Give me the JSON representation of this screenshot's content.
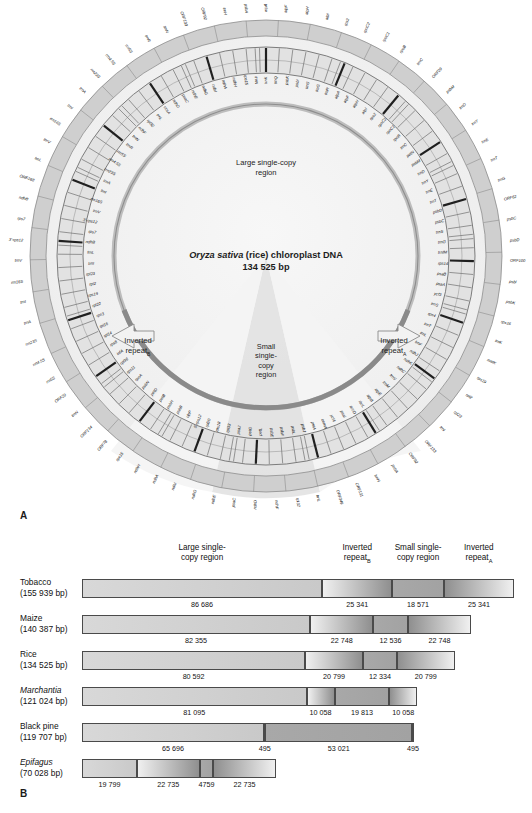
{
  "figure": {
    "panel_a_label": "A",
    "panel_b_label": "B"
  },
  "panel_a": {
    "title_species": "Oryza sativa",
    "title_rest": " (rice) chloroplast DNA",
    "title_size": "134 525 bp",
    "regions": {
      "lsc": "Large single-copy\nregion",
      "lsc_line1": "Large single-copy",
      "lsc_line2": "region",
      "irb_line1": "Inverted",
      "irb_line2": "repeat",
      "irb_sub": "B",
      "ira_line1": "Inverted",
      "ira_line2": "repeat",
      "ira_sub": "A",
      "ssc_line1": "Small",
      "ssc_line2": "single-",
      "ssc_line3": "copy",
      "ssc_line4": "region"
    },
    "genes_outer": [
      "atpA",
      "atpF",
      "atpH",
      "atpI",
      "rps2",
      "rpoC2",
      "rpoC1",
      "rpoB",
      "trnC",
      "ORF29",
      "psbM",
      "trnD",
      "trnY",
      "trnE",
      "trnT",
      "trnG",
      "ORF62",
      "psbC",
      "psbD",
      "ORF100",
      "psbI",
      "psbK",
      "rps16",
      "trnK",
      "matK",
      "rps19",
      "rpl2",
      "rpl23",
      "trnI",
      "ORF133",
      "ORF92",
      "psbA",
      "trnH",
      "ORF131",
      "ORF349",
      "trnL",
      "rpl32",
      "ndhF",
      "ndhD",
      "psaC",
      "ndhE",
      "ndhG",
      "ndhI",
      "ndhA",
      "ndhH",
      "rps15",
      "ORF78",
      "ORF134",
      "trnN",
      "ORF29",
      "rrn5S",
      "rrn4.5S",
      "rrn23S",
      "trnA",
      "trnI",
      "rrn16S",
      "trnV",
      "3'-rps12",
      "rps7",
      "ndhB",
      "ORF168",
      "trnL",
      "trnV",
      "rrn16S",
      "trnI",
      "trnA",
      "rrn23S",
      "rrn4.5S",
      "rrn5S",
      "trnR",
      "trnN",
      "ORF133",
      "ORF92",
      "trnH",
      "psbA"
    ],
    "genes_inner": [
      "trnK",
      "trnQ",
      "psbK",
      "psbI",
      "trnS",
      "trnG",
      "trnR",
      "atpA",
      "atpF",
      "atpH",
      "atpI",
      "rps2",
      "rpoC2",
      "rpoC1",
      "rpoB",
      "trnC",
      "petN",
      "psbM",
      "trnD",
      "trnY",
      "trnE",
      "trnT",
      "psbD",
      "psbC",
      "trnS",
      "trnG",
      "trnfM",
      "rps14",
      "psaB",
      "psaA",
      "ycf3",
      "trnS",
      "rps4",
      "trnT",
      "trnL",
      "trnF",
      "ndhJ",
      "ndhK",
      "ndhC",
      "trnV",
      "trnM",
      "atpE",
      "atpB",
      "rbcL",
      "accD",
      "psaI",
      "ycf4",
      "cemA",
      "petA",
      "psbJ",
      "psbL",
      "psbF",
      "psbE",
      "petL",
      "petG",
      "psaJ",
      "rpl33",
      "rps18",
      "rpl20",
      "5'-rps12",
      "clpP",
      "psbB",
      "psbH",
      "petB",
      "petD",
      "psbN",
      "rpoA",
      "rps11",
      "rpl36",
      "infA",
      "rps8",
      "rpl14",
      "rpl16",
      "rps3",
      "rpl22",
      "rps19",
      "rpl2",
      "rpl23",
      "trnI",
      "trnL",
      "ndhB",
      "rps7",
      "3'-rps12",
      "trnV",
      "rrn16S",
      "trnI",
      "trnA",
      "rrn23S",
      "rrn4.5S",
      "rrn5S",
      "trnR",
      "trnN",
      "ndhF",
      "rpl32",
      "trnL",
      "ccsA",
      "ndhD",
      "psaC",
      "ndhE",
      "ndhG",
      "ndhI",
      "ndhA",
      "ndhH",
      "rps15",
      "trnN"
    ]
  },
  "panel_b": {
    "column_headers": [
      {
        "line1": "Large single-",
        "line2": "copy region",
        "sub": ""
      },
      {
        "line1": "Inverted",
        "line2": "repeat",
        "sub": "B"
      },
      {
        "line1": "Small single-",
        "line2": "copy region",
        "sub": ""
      },
      {
        "line1": "Inverted",
        "line2": "repeat",
        "sub": "A"
      }
    ],
    "rows": [
      {
        "name": "Tobacco",
        "italic": false,
        "size": "(155 939 bp)",
        "total": 155939,
        "segments": [
          {
            "label": "86 686",
            "value": 86686,
            "kind": "lsc"
          },
          {
            "label": "25 341",
            "value": 25341,
            "kind": "ir"
          },
          {
            "label": "18 571",
            "value": 18571,
            "kind": "ssc"
          },
          {
            "label": "25 341",
            "value": 25341,
            "kind": "ir"
          }
        ]
      },
      {
        "name": "Maize",
        "italic": false,
        "size": "(140 387 bp)",
        "total": 140387,
        "segments": [
          {
            "label": "82 355",
            "value": 82355,
            "kind": "lsc"
          },
          {
            "label": "22 748",
            "value": 22748,
            "kind": "ir"
          },
          {
            "label": "12 536",
            "value": 12536,
            "kind": "ssc"
          },
          {
            "label": "22 748",
            "value": 22748,
            "kind": "ir"
          }
        ]
      },
      {
        "name": "Rice",
        "italic": false,
        "size": "(134 525 bp)",
        "total": 134525,
        "segments": [
          {
            "label": "80 592",
            "value": 80592,
            "kind": "lsc"
          },
          {
            "label": "20 799",
            "value": 20799,
            "kind": "ir"
          },
          {
            "label": "12 334",
            "value": 12334,
            "kind": "ssc"
          },
          {
            "label": "20 799",
            "value": 20799,
            "kind": "ir"
          }
        ]
      },
      {
        "name": "Marchantia",
        "italic": true,
        "size": "(121 024 bp)",
        "total": 121024,
        "segments": [
          {
            "label": "81 095",
            "value": 81095,
            "kind": "lsc"
          },
          {
            "label": "10 058",
            "value": 10058,
            "kind": "ir"
          },
          {
            "label": "19 813",
            "value": 19813,
            "kind": "ssc"
          },
          {
            "label": "10 058",
            "value": 10058,
            "kind": "ir"
          }
        ]
      },
      {
        "name": "Black pine",
        "italic": false,
        "size": "(119 707 bp)",
        "total": 119707,
        "segments": [
          {
            "label": "65 696",
            "value": 65696,
            "kind": "lsc"
          },
          {
            "label": "495",
            "value": 495,
            "kind": "ir"
          },
          {
            "label": "53 021",
            "value": 53021,
            "kind": "ssc"
          },
          {
            "label": "495",
            "value": 495,
            "kind": "ir"
          }
        ]
      },
      {
        "name": "Epifagus",
        "italic": true,
        "size": "(70 028 bp)",
        "total": 70028,
        "segments": [
          {
            "label": "19 799",
            "value": 19799,
            "kind": "lsc"
          },
          {
            "label": "22 735",
            "value": 22735,
            "kind": "ir"
          },
          {
            "label": "4759",
            "value": 4759,
            "kind": "ssc"
          },
          {
            "label": "22 735",
            "value": 22735,
            "kind": "ir"
          }
        ]
      }
    ]
  },
  "chart_data": {
    "type": "bar",
    "xlabel": "Genome length (bp)",
    "ylabel": "",
    "categories": [
      "Tobacco",
      "Maize",
      "Rice",
      "Marchantia",
      "Black pine",
      "Epifagus"
    ],
    "totals": [
      155939,
      140387,
      134525,
      121024,
      119707,
      70028
    ],
    "segment_names": [
      "Large single-copy region",
      "Inverted repeat B",
      "Small single-copy region",
      "Inverted repeat A"
    ],
    "series": [
      {
        "name": "Large single-copy region",
        "values": [
          86686,
          82355,
          80592,
          81095,
          65696,
          19799
        ]
      },
      {
        "name": "Inverted repeat B",
        "values": [
          25341,
          22748,
          20799,
          10058,
          495,
          22735
        ]
      },
      {
        "name": "Small single-copy region",
        "values": [
          18571,
          12536,
          12334,
          19813,
          53021,
          4759
        ]
      },
      {
        "name": "Inverted repeat A",
        "values": [
          25341,
          22748,
          20799,
          10058,
          495,
          22735
        ]
      }
    ],
    "legend_position": "top",
    "grid": false,
    "scale_max": 155939
  },
  "colors": {
    "lsc": "#d4d4d4",
    "ir_light": "#eeeeee",
    "ir_dark": "#9a9a9a",
    "ssc": "#a9a9a9",
    "outline": "#4a4a4a",
    "disc": "#efefef",
    "ring": "#cfcfcf",
    "ring_dark": "#8e8e8e",
    "gene_block": "#1a1a1a"
  }
}
